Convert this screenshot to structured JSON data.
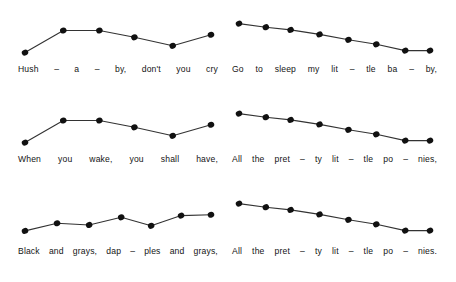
{
  "figure": {
    "background_color": "#ffffff",
    "ink_color": "#141414",
    "dot_color": "#111111",
    "line_color": "#333333"
  },
  "chart_data": [
    {
      "type": "line",
      "title": "",
      "id": "panel-1",
      "position": "top-left",
      "lyrics_line": "Hush - a - by, don't you cry",
      "tokens": [
        {
          "text": "Hush",
          "type": "syllable"
        },
        {
          "text": "–",
          "type": "sep"
        },
        {
          "text": "a",
          "type": "syllable"
        },
        {
          "text": "–",
          "type": "sep"
        },
        {
          "text": "by,",
          "type": "syllable"
        },
        {
          "text": "don't",
          "type": "syllable"
        },
        {
          "text": "you",
          "type": "syllable"
        },
        {
          "text": "cry",
          "type": "syllable"
        }
      ],
      "categories": [
        "Hush",
        "a",
        "by,",
        "don't",
        "you",
        "cry"
      ],
      "x": [
        10,
        45,
        78,
        110,
        145,
        180
      ],
      "values": [
        4,
        30,
        30,
        22,
        12,
        25
      ],
      "ylim": [
        0,
        40
      ],
      "xlabel": "",
      "ylabel": "",
      "grid": false,
      "legend": "none"
    },
    {
      "type": "line",
      "title": "",
      "id": "panel-2",
      "position": "top-right",
      "lyrics_line": "Go to sleep my lit - tle ba - by,",
      "tokens": [
        {
          "text": "Go",
          "type": "syllable"
        },
        {
          "text": "to",
          "type": "syllable"
        },
        {
          "text": "sleep",
          "type": "syllable"
        },
        {
          "text": "my",
          "type": "syllable"
        },
        {
          "text": "lit",
          "type": "syllable"
        },
        {
          "text": "–",
          "type": "sep"
        },
        {
          "text": "tle",
          "type": "syllable"
        },
        {
          "text": "ba",
          "type": "syllable"
        },
        {
          "text": "–",
          "type": "sep"
        },
        {
          "text": "by,",
          "type": "syllable"
        }
      ],
      "categories": [
        "Go",
        "to",
        "sleep",
        "my",
        "lit",
        "tle",
        "ba",
        "by,"
      ],
      "x": [
        10,
        36,
        60,
        88,
        116,
        143,
        171,
        195
      ],
      "values": [
        36,
        32,
        29,
        24,
        18,
        13,
        6,
        6
      ],
      "ylim": [
        0,
        40
      ],
      "xlabel": "",
      "ylabel": "",
      "grid": false,
      "legend": "none"
    },
    {
      "type": "line",
      "title": "",
      "id": "panel-3",
      "position": "middle-left",
      "lyrics_line": "When you wake, you shall have,",
      "tokens": [
        {
          "text": "When",
          "type": "syllable"
        },
        {
          "text": "you",
          "type": "syllable"
        },
        {
          "text": "wake,",
          "type": "syllable"
        },
        {
          "text": "you",
          "type": "syllable"
        },
        {
          "text": "shall",
          "type": "syllable"
        },
        {
          "text": "have,",
          "type": "syllable"
        }
      ],
      "categories": [
        "When",
        "you",
        "wake,",
        "you",
        "shall",
        "have,"
      ],
      "x": [
        10,
        45,
        78,
        110,
        145,
        180
      ],
      "values": [
        4,
        30,
        30,
        22,
        12,
        25
      ],
      "ylim": [
        0,
        40
      ],
      "xlabel": "",
      "ylabel": "",
      "grid": false,
      "legend": "none"
    },
    {
      "type": "line",
      "title": "",
      "id": "panel-4",
      "position": "middle-right",
      "lyrics_line": "All the pret - ty lit - tle po - nies,",
      "tokens": [
        {
          "text": "All",
          "type": "syllable"
        },
        {
          "text": "the",
          "type": "syllable"
        },
        {
          "text": "pret",
          "type": "syllable"
        },
        {
          "text": "–",
          "type": "sep"
        },
        {
          "text": "ty",
          "type": "syllable"
        },
        {
          "text": "lit",
          "type": "syllable"
        },
        {
          "text": "–",
          "type": "sep"
        },
        {
          "text": "tle",
          "type": "syllable"
        },
        {
          "text": "po",
          "type": "syllable"
        },
        {
          "text": "–",
          "type": "sep"
        },
        {
          "text": "nies,",
          "type": "syllable"
        }
      ],
      "categories": [
        "All",
        "the",
        "pret",
        "ty",
        "lit",
        "tle",
        "po",
        "nies,"
      ],
      "x": [
        10,
        36,
        60,
        88,
        116,
        143,
        171,
        195
      ],
      "values": [
        36,
        32,
        29,
        24,
        18,
        13,
        6,
        6
      ],
      "ylim": [
        0,
        40
      ],
      "xlabel": "",
      "ylabel": "",
      "grid": false,
      "legend": "none"
    },
    {
      "type": "line",
      "title": "",
      "id": "panel-5",
      "position": "bottom-left",
      "lyrics_line": "Black and grays, dap - ples and grays,",
      "tokens": [
        {
          "text": "Black",
          "type": "syllable"
        },
        {
          "text": "and",
          "type": "syllable"
        },
        {
          "text": "grays,",
          "type": "syllable"
        },
        {
          "text": "dap",
          "type": "syllable"
        },
        {
          "text": "–",
          "type": "sep"
        },
        {
          "text": "ples",
          "type": "syllable"
        },
        {
          "text": "and",
          "type": "syllable"
        },
        {
          "text": "grays,",
          "type": "syllable"
        }
      ],
      "categories": [
        "Black",
        "and",
        "grays,",
        "dap",
        "ples",
        "and",
        "grays,"
      ],
      "x": [
        10,
        40,
        70,
        100,
        128,
        156,
        184
      ],
      "values": [
        6,
        15,
        13,
        22,
        12,
        24,
        25
      ],
      "ylim": [
        0,
        40
      ],
      "xlabel": "",
      "ylabel": "",
      "grid": false,
      "legend": "none"
    },
    {
      "type": "line",
      "title": "",
      "id": "panel-6",
      "position": "bottom-right",
      "lyrics_line": "All the pret - ty lit - tle po - nies.",
      "tokens": [
        {
          "text": "All",
          "type": "syllable"
        },
        {
          "text": "the",
          "type": "syllable"
        },
        {
          "text": "pret",
          "type": "syllable"
        },
        {
          "text": "–",
          "type": "sep"
        },
        {
          "text": "ty",
          "type": "syllable"
        },
        {
          "text": "lit",
          "type": "syllable"
        },
        {
          "text": "–",
          "type": "sep"
        },
        {
          "text": "tle",
          "type": "syllable"
        },
        {
          "text": "po",
          "type": "syllable"
        },
        {
          "text": "–",
          "type": "sep"
        },
        {
          "text": "nies.",
          "type": "syllable"
        }
      ],
      "categories": [
        "All",
        "the",
        "pret",
        "ty",
        "lit",
        "tle",
        "po",
        "nies."
      ],
      "x": [
        10,
        36,
        60,
        88,
        116,
        143,
        171,
        195
      ],
      "values": [
        36,
        32,
        29,
        24,
        18,
        13,
        6,
        6
      ],
      "ylim": [
        0,
        40
      ],
      "xlabel": "",
      "ylabel": "",
      "grid": false,
      "legend": "none"
    }
  ],
  "panels_layout": [
    {
      "left": 18,
      "top": 16,
      "plot_w": 200,
      "plot_h": 46,
      "lyric_top": 64,
      "lyric_w": 200,
      "gaps": [
        0,
        0,
        0,
        0,
        0,
        0,
        0,
        0,
        0,
        0,
        0
      ]
    },
    {
      "left": 232,
      "top": 14,
      "plot_w": 205,
      "plot_h": 48,
      "lyric_top": 64,
      "lyric_w": 205,
      "gaps": [
        0,
        0,
        0,
        0,
        0,
        0,
        0,
        0,
        0,
        0,
        0
      ]
    },
    {
      "left": 18,
      "top": 106,
      "plot_w": 200,
      "plot_h": 46,
      "lyric_top": 154,
      "lyric_w": 200,
      "gaps": [
        0,
        0,
        0,
        0,
        0,
        0,
        0,
        0,
        0,
        0,
        0
      ]
    },
    {
      "left": 232,
      "top": 104,
      "plot_w": 205,
      "plot_h": 48,
      "lyric_top": 154,
      "lyric_w": 205,
      "gaps": [
        0,
        0,
        0,
        0,
        0,
        0,
        0,
        0,
        0,
        0,
        0
      ]
    },
    {
      "left": 18,
      "top": 196,
      "plot_w": 200,
      "plot_h": 46,
      "lyric_top": 246,
      "lyric_w": 200,
      "gaps": [
        0,
        0,
        0,
        0,
        0,
        0,
        0,
        0,
        0,
        0,
        0
      ]
    },
    {
      "left": 232,
      "top": 194,
      "plot_w": 205,
      "plot_h": 48,
      "lyric_top": 246,
      "lyric_w": 205,
      "gaps": [
        0,
        0,
        0,
        0,
        0,
        0,
        0,
        0,
        0,
        0,
        0
      ]
    }
  ]
}
